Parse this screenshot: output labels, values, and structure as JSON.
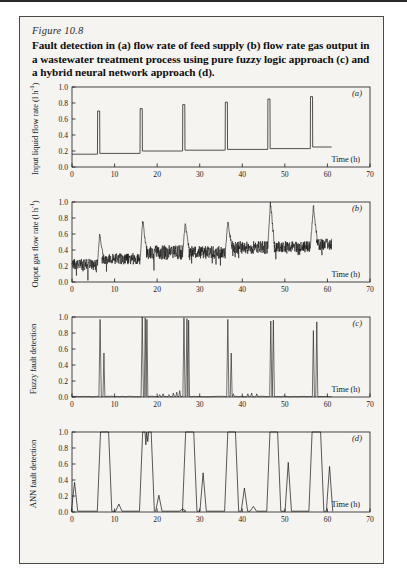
{
  "figure": {
    "number_label": "Figure 10.8",
    "caption": "Fault detection in (a) flow rate of feed supply (b) flow rate gas output in a wastewater treatment process using pure fuzzy logic approach (c) and a hybrid neural network approach (d).",
    "background_color": "#f6f4f0",
    "line_color": "#1a1a1a"
  },
  "axis": {
    "x_label": "Time (h)",
    "x_ticks": [
      0,
      10,
      20,
      30,
      40,
      50,
      60,
      70
    ],
    "y_ticks": [
      0.0,
      0.2,
      0.4,
      0.6,
      0.8,
      1.0
    ],
    "y_tick_labels": [
      "0.0",
      "0.2",
      "0.4",
      "0.6",
      "0.8",
      "1.0"
    ]
  },
  "panels": [
    {
      "key": "a",
      "letter": "(a)",
      "ylabel": "Input  liquid flow rate (l h",
      "ylabel_sup": "-1",
      "ylabel_tail": ")"
    },
    {
      "key": "b",
      "letter": "(b)",
      "ylabel": "Ouput gas flow rate (l h",
      "ylabel_sup": "-1",
      "ylabel_tail": ")"
    },
    {
      "key": "c",
      "letter": "(c)",
      "ylabel": "Fuzzy fault detection",
      "ylabel_sup": "",
      "ylabel_tail": ""
    },
    {
      "key": "d",
      "letter": "(d)",
      "ylabel": "ANN fault detection",
      "ylabel_sup": "",
      "ylabel_tail": ""
    }
  ],
  "chart_data": [
    {
      "type": "line",
      "panel": "a",
      "title": "Input liquid flow rate",
      "xlabel": "Time (h)",
      "ylabel": "Input liquid flow rate (l h-1)",
      "xlim": [
        0,
        70
      ],
      "ylim": [
        0.0,
        1.0
      ],
      "grid": false,
      "legend": "none",
      "description": "Step baseline with six sharp narrow spikes at the fault times",
      "baseline_segments": [
        {
          "x_start": 0,
          "x_end": 5.8,
          "value": 0.16
        },
        {
          "x_start": 6.6,
          "x_end": 15.8,
          "value": 0.17
        },
        {
          "x_start": 16.6,
          "x_end": 25.8,
          "value": 0.2
        },
        {
          "x_start": 26.6,
          "x_end": 35.8,
          "value": 0.21
        },
        {
          "x_start": 36.6,
          "x_end": 45.8,
          "value": 0.22
        },
        {
          "x_start": 46.6,
          "x_end": 55.8,
          "value": 0.23
        },
        {
          "x_start": 56.6,
          "x_end": 61.0,
          "value": 0.25
        }
      ],
      "spikes": [
        {
          "x": 6.2,
          "height": 0.7
        },
        {
          "x": 16.2,
          "height": 0.73
        },
        {
          "x": 26.2,
          "height": 0.78
        },
        {
          "x": 36.2,
          "height": 0.81
        },
        {
          "x": 46.2,
          "height": 0.85
        },
        {
          "x": 56.2,
          "height": 0.88
        }
      ],
      "data_end_x": 61
    },
    {
      "type": "line",
      "panel": "b",
      "title": "Output gas flow rate",
      "xlabel": "Time (h)",
      "ylabel": "Ouput gas flow rate (l h-1)",
      "xlim": [
        0,
        70
      ],
      "ylim": [
        0.0,
        1.0
      ],
      "grid": false,
      "legend": "none",
      "description": "Noisy signal with rising baseline and six peaks just after each fault",
      "baseline_segments": [
        {
          "x_start": 0,
          "x_end": 6.0,
          "value": 0.22,
          "noise": 0.07
        },
        {
          "x_start": 7.0,
          "x_end": 16.0,
          "value": 0.29,
          "noise": 0.07
        },
        {
          "x_start": 17.5,
          "x_end": 26.0,
          "value": 0.37,
          "noise": 0.09
        },
        {
          "x_start": 27.5,
          "x_end": 36.0,
          "value": 0.37,
          "noise": 0.08
        },
        {
          "x_start": 37.5,
          "x_end": 46.0,
          "value": 0.43,
          "noise": 0.08
        },
        {
          "x_start": 47.5,
          "x_end": 56.0,
          "value": 0.44,
          "noise": 0.07
        },
        {
          "x_start": 57.5,
          "x_end": 61.0,
          "value": 0.47,
          "noise": 0.07
        }
      ],
      "peaks": [
        {
          "x": 6.5,
          "height": 0.6
        },
        {
          "x": 16.6,
          "height": 0.76
        },
        {
          "x": 26.6,
          "height": 0.73
        },
        {
          "x": 36.6,
          "height": 0.75
        },
        {
          "x": 46.6,
          "height": 1.0
        },
        {
          "x": 56.7,
          "height": 0.95
        }
      ],
      "data_end_x": 61
    },
    {
      "type": "line",
      "panel": "c",
      "title": "Fuzzy fault detection",
      "xlabel": "Time (h)",
      "ylabel": "Fuzzy fault detection",
      "xlim": [
        0,
        70
      ],
      "ylim": [
        0.0,
        1.0
      ],
      "grid": false,
      "legend": "none",
      "description": "Baseline near zero with pairs of very narrow spikes at each fault",
      "spikes": [
        {
          "x": 6.6,
          "height": 0.97,
          "width": 0.28
        },
        {
          "x": 7.5,
          "height": 0.55,
          "width": 0.22
        },
        {
          "x": 16.5,
          "height": 1.0,
          "width": 0.28
        },
        {
          "x": 17.2,
          "height": 0.99,
          "width": 0.22
        },
        {
          "x": 17.6,
          "height": 0.97,
          "width": 0.22
        },
        {
          "x": 26.3,
          "height": 0.99,
          "width": 0.26
        },
        {
          "x": 27.0,
          "height": 0.98,
          "width": 0.24
        },
        {
          "x": 27.4,
          "height": 0.96,
          "width": 0.2
        },
        {
          "x": 36.6,
          "height": 0.97,
          "width": 0.26
        },
        {
          "x": 37.4,
          "height": 0.55,
          "width": 0.22
        },
        {
          "x": 46.7,
          "height": 0.95,
          "width": 0.26
        },
        {
          "x": 47.3,
          "height": 0.96,
          "width": 0.24
        },
        {
          "x": 56.7,
          "height": 0.83,
          "width": 0.24
        },
        {
          "x": 57.5,
          "height": 0.94,
          "width": 0.24
        }
      ],
      "small_bumps": [
        {
          "x": 20.6,
          "height": 0.03
        },
        {
          "x": 21.4,
          "height": 0.04
        },
        {
          "x": 22.8,
          "height": 0.03
        },
        {
          "x": 23.8,
          "height": 0.05
        },
        {
          "x": 24.6,
          "height": 0.06
        },
        {
          "x": 25.3,
          "height": 0.08
        },
        {
          "x": 37.9,
          "height": 0.04
        },
        {
          "x": 41.3,
          "height": 0.04
        },
        {
          "x": 42.2,
          "height": 0.05
        },
        {
          "x": 43.4,
          "height": 0.04
        }
      ],
      "data_end_x": 61
    },
    {
      "type": "line",
      "panel": "d",
      "title": "ANN fault detection",
      "xlabel": "Time (h)",
      "ylabel": "ANN fault detection",
      "xlim": [
        0,
        70
      ],
      "ylim": [
        0.0,
        1.0
      ],
      "grid": false,
      "legend": "none",
      "description": "Broad saturated pulses reaching 1.0 at each fault plus smaller secondary bumps",
      "pulses": [
        {
          "x_start": 6.7,
          "x_end": 8.6,
          "height": 1.0
        },
        {
          "x_start": 16.6,
          "x_end": 18.6,
          "height": 1.0,
          "notched": true
        },
        {
          "x_start": 26.7,
          "x_end": 28.6,
          "height": 1.0
        },
        {
          "x_start": 36.6,
          "x_end": 38.4,
          "height": 1.0
        },
        {
          "x_start": 46.5,
          "x_end": 48.3,
          "height": 1.0
        },
        {
          "x_start": 56.4,
          "x_end": 58.4,
          "height": 1.0
        }
      ],
      "bumps": [
        {
          "x": 0.6,
          "height": 0.37
        },
        {
          "x": 11.0,
          "height": 0.1
        },
        {
          "x": 20.4,
          "height": 0.21
        },
        {
          "x": 26.0,
          "height": 0.04
        },
        {
          "x": 30.8,
          "height": 0.49
        },
        {
          "x": 40.5,
          "height": 0.3
        },
        {
          "x": 42.6,
          "height": 0.07
        },
        {
          "x": 50.8,
          "height": 0.62
        },
        {
          "x": 60.5,
          "height": 0.57
        }
      ],
      "data_end_x": 62
    }
  ]
}
